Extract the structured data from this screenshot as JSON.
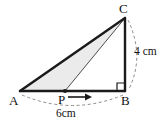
{
  "figure": {
    "type": "geometry-diagram",
    "background_color": "#ffffff",
    "stroke_color": "#1a1a1a",
    "thin_stroke_color": "#555555",
    "dashed_color": "#8a8a8a",
    "shaded_fill": "#ebebeb"
  },
  "vertices": {
    "A": {
      "label": "A",
      "x": 20,
      "y": 91
    },
    "B": {
      "label": "B",
      "x": 125,
      "y": 91
    },
    "C": {
      "label": "C",
      "x": 125,
      "y": 18
    },
    "P": {
      "label": "P",
      "x": 65,
      "y": 91
    }
  },
  "dimensions": {
    "base": {
      "label": "6cm",
      "value": 6,
      "unit": "cm",
      "segment": "AB"
    },
    "height": {
      "label": "4 cm",
      "value": 4,
      "unit": "cm",
      "segment": "CB"
    }
  },
  "markers": {
    "right_angle": {
      "name": "right-angle-mark",
      "at": "B"
    },
    "motion_arrow": {
      "name": "motion-arrow",
      "from": "P",
      "direction": "right"
    },
    "point_dot": {
      "name": "point-p-dot",
      "at": "P"
    }
  },
  "shaded_region": {
    "name": "shaded-triangle-APC",
    "vertices": [
      "A",
      "P",
      "C"
    ]
  }
}
